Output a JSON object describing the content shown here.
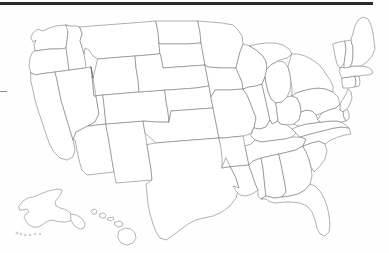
{
  "document": {
    "kind": "blank-us-states-outline-map",
    "title": "",
    "caption": "",
    "background_color": "#fefefe",
    "width": 389,
    "height": 253
  },
  "style": {
    "state_border_color": "#6f6f6f",
    "state_fill_color": "#ffffff",
    "inset_border_color": "#7b7b7b",
    "scan_artifact_color": "#2b2b2b",
    "left_dash_color": "#8d8d8d",
    "stroke_width": 0.55
  },
  "artifacts": [
    {
      "name": "scan-top-edge",
      "description": "",
      "x": 0,
      "y": 2,
      "width": 373,
      "height": 3,
      "color": "#2b2b2b"
    },
    {
      "name": "scan-left-dash",
      "description": "",
      "x": 0,
      "y": 91,
      "width": 7,
      "height": 1,
      "color": "#8d8d8d"
    }
  ],
  "map": {
    "region": "United States",
    "labels_visible": false,
    "legend_visible": false,
    "insets": [
      "Alaska",
      "Hawaii"
    ],
    "state_count": 49,
    "states": [
      {
        "code": "WA",
        "name": "Washington",
        "d": "M33 33 L38 29 L43 31 L49 28 L56 26 L66 25 L70 26 L68 32 L67 41 L66 48 L60 49 L50 49 L42 50 L35 51 L34 45 L36 40 L33 42 L31 38 Z"
      },
      {
        "code": "OR",
        "name": "Oregon",
        "d": "M35 51 L42 50 L50 49 L60 49 L66 48 L67 55 L68 62 L69 70 L63 71 L55 72 L47 73 L40 74 L36 75 L31 73 L29 66 L30 58 L32 53 Z"
      },
      {
        "code": "CA",
        "name": "California",
        "d": "M31 73 L36 75 L40 74 L47 73 L55 72 L57 80 L59 90 L61 100 L64 110 L67 120 L70 130 L73 140 L75 150 L73 157 L67 160 L60 158 L54 152 L50 145 L47 137 L44 128 L41 119 L38 110 L35 100 L33 90 L31 82 Z"
      },
      {
        "code": "NV",
        "name": "Nevada",
        "d": "M69 70 L76 69 L84 68 L91 67 L93 78 L95 90 L97 102 L99 114 L95 122 L88 126 L82 129 L76 132 L73 140 L70 130 L67 120 L64 110 L61 100 L59 90 L57 80 L55 72 L63 71 Z"
      },
      {
        "code": "ID",
        "name": "Idaho",
        "d": "M66 25 L70 26 L76 26 L80 27 L82 34 L80 41 L82 47 L84 54 L85 60 L86 67 L84 68 L76 69 L69 70 L68 62 L67 55 L66 48 L67 41 L68 32 Z"
      },
      {
        "code": "MT",
        "name": "Montana",
        "d": "M80 27 L92 26 L105 25 L118 24 L131 23 L144 22 L156 21 L158 32 L159 43 L160 54 L148 55 L135 56 L122 57 L110 58 L98 59 L93 56 L89 50 L85 48 L84 54 L82 47 L80 41 L82 34 Z"
      },
      {
        "code": "WY",
        "name": "Wyoming",
        "d": "M98 59 L110 58 L122 57 L135 56 L136 68 L138 80 L139 92 L127 93 L115 94 L103 95 L94 96 L93 86 L92 76 L91 67 L93 78 Z"
      },
      {
        "code": "UT",
        "name": "Utah",
        "d": "M91 67 L93 78 L92 76 L93 86 L94 96 L103 95 L104 105 L105 115 L106 124 L97 125 L90 126 L88 126 L95 122 L99 114 L97 102 L95 90 L93 78 Z"
      },
      {
        "code": "AZ",
        "name": "Arizona",
        "d": "M88 126 L90 126 L97 125 L106 124 L108 136 L110 148 L112 160 L114 172 L105 173 L96 174 L87 175 L82 170 L79 160 L77 150 L75 140 L73 140 L76 132 L82 129 Z"
      },
      {
        "code": "NM",
        "name": "New Mexico",
        "d": "M106 124 L118 123 L130 122 L143 121 L145 133 L147 145 L149 157 L151 169 L152 180 L140 181 L128 182 L116 183 L114 172 L112 160 L110 148 L108 136 Z"
      },
      {
        "code": "CO",
        "name": "Colorado",
        "d": "M103 95 L115 94 L127 93 L139 92 L152 91 L165 90 L166 101 L168 112 L169 122 L156 122 L143 121 L130 122 L118 123 L106 124 L105 115 L104 105 Z"
      },
      {
        "code": "ND",
        "name": "North Dakota",
        "d": "M156 21 L170 21 L184 21 L198 21 L200 32 L201 43 L187 44 L173 44 L160 44 L159 43 L158 32 Z"
      },
      {
        "code": "SD",
        "name": "South Dakota",
        "d": "M159 43 L160 44 L173 44 L187 44 L201 43 L203 54 L205 65 L191 66 L177 67 L163 68 L161 57 L160 54 Z"
      },
      {
        "code": "NE",
        "name": "Nebraska",
        "d": "M160 54 L161 57 L163 68 L177 67 L191 66 L205 65 L207 76 L209 86 L196 88 L182 89 L168 90 L165 90 L152 91 L139 92 L138 80 L136 68 L135 56 L148 55 Z"
      },
      {
        "code": "KS",
        "name": "Kansas",
        "d": "M165 90 L168 90 L182 89 L196 88 L209 86 L211 97 L213 108 L199 109 L185 110 L171 111 L169 122 L168 112 L166 101 Z"
      },
      {
        "code": "OK",
        "name": "Oklahoma",
        "d": "M169 122 L171 111 L185 110 L199 109 L213 108 L215 118 L217 128 L219 138 L206 139 L193 140 L180 141 L168 142 L156 143 L145 133 L143 121 L156 122 Z"
      },
      {
        "code": "TX",
        "name": "Texas",
        "d": "M156 143 L168 142 L180 141 L193 140 L206 139 L219 138 L222 148 L226 158 L231 168 L236 178 L239 188 L236 198 L230 206 L222 212 L213 216 L204 218 L196 220 L188 224 L180 230 L172 236 L166 240 L160 238 L156 232 L153 224 L150 214 L148 204 L147 194 L146 184 L152 180 L151 169 L149 157 L147 145 Z"
      },
      {
        "code": "MN",
        "name": "Minnesota",
        "d": "M198 21 L210 22 L222 23 L233 25 L238 30 L242 36 L243 44 L240 52 L238 60 L236 68 L222 68 L208 67 L205 65 L203 54 L201 43 L200 32 Z"
      },
      {
        "code": "IA",
        "name": "Iowa",
        "d": "M205 65 L208 67 L222 68 L236 68 L239 75 L242 82 L243 89 L229 90 L215 90 L211 97 L209 86 L207 76 Z"
      },
      {
        "code": "MO",
        "name": "Missouri",
        "d": "M211 97 L215 90 L229 90 L243 89 L247 95 L250 102 L253 110 L256 118 L254 128 L250 134 L243 136 L233 137 L224 138 L219 138 L217 128 L215 118 L213 108 Z"
      },
      {
        "code": "AR",
        "name": "Arkansas",
        "d": "M219 138 L224 138 L233 137 L243 136 L245 146 L247 156 L249 165 L238 166 L227 167 L222 168 L222 158 L221 148 Z"
      },
      {
        "code": "LA",
        "name": "Louisiana",
        "d": "M222 168 L227 167 L238 166 L249 165 L252 174 L255 183 L258 190 L252 194 L246 196 L240 195 L236 191 L233 186 L239 188 L236 178 L231 168 L226 158 Z"
      },
      {
        "code": "WI",
        "name": "Wisconsin",
        "d": "M236 68 L238 60 L240 52 L243 44 L250 46 L256 50 L262 55 L266 61 L267 69 L265 77 L262 84 L256 86 L249 87 L243 89 L242 82 L239 75 Z"
      },
      {
        "code": "MI-LP",
        "name": "Michigan Lower Peninsula",
        "d": "M267 69 L272 64 L278 61 L284 62 L288 67 L290 74 L291 82 L290 90 L287 97 L282 102 L276 103 L271 99 L268 92 L266 84 L265 77 Z"
      },
      {
        "code": "MI-UP",
        "name": "Michigan Upper Peninsula",
        "d": "M250 46 L258 44 L266 43 L275 43 L283 45 L289 49 L292 54 L287 58 L280 60 L272 64 L267 69 L266 61 L262 55 L256 50 Z"
      },
      {
        "code": "IL",
        "name": "Illinois",
        "d": "M243 89 L249 87 L256 86 L262 84 L264 93 L266 102 L268 111 L270 120 L266 127 L260 129 L254 128 L256 118 L253 110 L250 102 L247 95 Z"
      },
      {
        "code": "IN",
        "name": "Indiana",
        "d": "M262 84 L265 77 L266 84 L268 92 L271 99 L276 103 L277 112 L278 121 L272 124 L270 120 L268 111 L266 102 L264 93 Z"
      },
      {
        "code": "OH",
        "name": "Ohio",
        "d": "M276 103 L282 102 L287 97 L292 96 L297 98 L300 104 L301 112 L299 120 L294 124 L287 125 L280 124 L278 121 L277 112 Z"
      },
      {
        "code": "KY",
        "name": "Kentucky",
        "d": "M254 128 L260 129 L266 127 L270 120 L272 124 L278 121 L280 124 L287 125 L292 129 L296 133 L292 137 L285 139 L277 140 L269 141 L261 142 L255 140 L251 136 Z"
      },
      {
        "code": "TN",
        "name": "Tennessee",
        "d": "M249 165 L247 156 L245 146 L251 144 L255 140 L261 142 L269 141 L277 140 L285 139 L292 137 L300 137 L306 139 L303 146 L296 150 L288 152 L279 154 L270 156 L261 158 L253 161 Z"
      },
      {
        "code": "MS",
        "name": "Mississippi",
        "d": "M249 165 L253 161 L261 158 L263 168 L264 178 L265 188 L266 196 L261 199 L258 196 L258 190 L255 183 L252 174 Z"
      },
      {
        "code": "AL",
        "name": "Alabama",
        "d": "M263 168 L261 158 L270 156 L279 154 L281 164 L283 174 L285 184 L286 192 L282 197 L274 198 L266 196 L265 188 L264 178 Z"
      },
      {
        "code": "GA",
        "name": "Georgia",
        "d": "M279 154 L288 152 L296 150 L303 146 L306 152 L309 159 L311 167 L312 176 L310 184 L305 190 L298 194 L290 196 L282 197 L286 192 L285 184 L283 174 L281 164 Z"
      },
      {
        "code": "FL",
        "name": "Florida",
        "d": "M282 197 L290 196 L298 194 L305 190 L310 184 L315 186 L320 191 L324 198 L327 206 L329 215 L330 224 L329 232 L325 236 L320 234 L317 228 L315 220 L312 212 L307 206 L300 203 L292 202 L284 202 L276 203 L270 202 L266 199 L261 199 L266 196 L274 198 Z"
      },
      {
        "code": "SC",
        "name": "South Carolina",
        "d": "M303 146 L311 143 L319 141 L325 144 L327 151 L325 159 L320 166 L314 172 L311 167 L309 159 L306 152 Z"
      },
      {
        "code": "NC",
        "name": "North Carolina",
        "d": "M300 137 L306 139 L303 146 L311 143 L319 141 L325 144 L331 140 L338 137 L345 135 L351 134 L349 128 L342 127 L334 128 L326 130 L318 132 L310 134 Z"
      },
      {
        "code": "VA",
        "name": "Virginia",
        "d": "M296 133 L292 129 L299 126 L306 124 L314 123 L322 122 L330 121 L337 121 L343 123 L349 128 L342 127 L334 128 L326 130 L318 132 L310 134 L300 137 Z"
      },
      {
        "code": "WV",
        "name": "West Virginia",
        "d": "M294 124 L299 120 L301 112 L306 110 L312 111 L316 115 L318 120 L320 122 L314 123 L306 124 L299 126 Z"
      },
      {
        "code": "PA",
        "name": "Pennsylvania",
        "d": "M292 96 L297 98 L300 104 L301 112 L306 110 L312 111 L316 115 L322 113 L329 110 L336 108 L340 104 L338 97 L333 92 L326 89 L318 88 L310 89 L302 91 L296 93 Z"
      },
      {
        "code": "NY",
        "name": "New York",
        "d": "M292 54 L298 54 L305 56 L311 59 L317 63 L322 68 L326 74 L330 80 L333 86 L333 92 L326 89 L318 88 L310 89 L302 91 L296 93 L292 96 L292 88 L291 82 L290 74 L288 67 Z"
      },
      {
        "code": "NJ",
        "name": "New Jersey",
        "d": "M340 104 L343 99 L346 94 L348 89 L351 92 L352 98 L350 104 L347 109 L343 112 L340 110 Z"
      },
      {
        "code": "DE",
        "name": "Delaware",
        "d": "M343 112 L347 109 L349 113 L349 119 L346 121 L344 118 Z"
      },
      {
        "code": "MD",
        "name": "Maryland",
        "d": "M322 113 L329 110 L336 108 L340 104 L340 110 L343 112 L344 118 L346 121 L341 122 L337 121 L330 121 L322 122 L320 122 L318 120 Z"
      },
      {
        "code": "CT",
        "name": "Connecticut",
        "d": "M342 78 L349 77 L355 76 L356 82 L355 87 L349 88 L343 88 L342 83 Z"
      },
      {
        "code": "RI",
        "name": "Rhode Island",
        "d": "M355 76 L359 76 L360 82 L359 86 L355 87 L356 82 Z"
      },
      {
        "code": "MA",
        "name": "Massachusetts",
        "d": "M340 68 L347 67 L354 66 L361 66 L367 67 L371 69 L373 73 L369 75 L364 75 L359 76 L355 76 L349 77 L342 78 L340 74 Z"
      },
      {
        "code": "VT",
        "name": "Vermont",
        "d": "M333 44 L339 42 L345 41 L346 49 L345 57 L344 64 L340 68 L337 64 L335 56 L334 50 Z"
      },
      {
        "code": "NH",
        "name": "New Hampshire",
        "d": "M345 41 L351 40 L353 48 L353 56 L352 63 L350 67 L344 68 L344 64 L345 57 L346 49 Z"
      },
      {
        "code": "ME",
        "name": "Maine",
        "d": "M351 40 L353 33 L355 26 L358 20 L363 17 L368 19 L371 25 L373 33 L374 41 L375 49 L372 56 L367 62 L361 66 L354 66 L350 67 L352 63 L353 56 L353 48 Z"
      }
    ],
    "alaska_inset": {
      "name": "Alaska",
      "d": "M19 206 L23 201 L28 198 L33 197 L38 195 L43 193 L48 191 L53 190 L58 189 L62 190 L61 194 L58 198 L55 202 L56 206 L60 208 L64 209 L68 211 L71 214 L73 218 L70 221 L66 222 L61 222 L56 221 L51 220 L46 222 L42 225 L38 227 L33 227 L29 225 L26 221 L24 217 L26 214 L29 212 L27 209 L23 210 L20 210 Z",
      "panhandle_d": "M71 214 L76 215 L80 217 L83 220 L85 224 L84 228 L80 229 L76 227 L73 224 L71 220 Z",
      "aleutians": [
        {
          "cx": 17,
          "cy": 233,
          "r": 1.0
        },
        {
          "cx": 21,
          "cy": 234,
          "r": 0.9
        },
        {
          "cx": 25,
          "cy": 235,
          "r": 0.9
        },
        {
          "cx": 30,
          "cy": 235,
          "r": 0.8
        },
        {
          "cx": 35,
          "cy": 234,
          "r": 0.8
        },
        {
          "cx": 40,
          "cy": 234,
          "r": 0.8
        }
      ]
    },
    "hawaii_inset": {
      "name": "Hawaii",
      "islands": [
        {
          "island": "Kauai",
          "d": "M92 210 L95 209 L97 211 L96 214 L93 214 L91 212 Z"
        },
        {
          "island": "Oahu",
          "d": "M100 214 L104 213 L106 215 L105 218 L102 218 L100 217 Z"
        },
        {
          "island": "Molokai",
          "d": "M108 218 L113 217 L114 219 L111 221 L108 220 Z"
        },
        {
          "island": "Maui",
          "d": "M115 222 L120 221 L123 223 L122 226 L118 227 L115 225 Z"
        },
        {
          "island": "Hawaii (Big Island)",
          "d": "M119 231 L125 228 L131 229 L135 233 L136 238 L133 243 L127 245 L121 243 L118 238 Z"
        }
      ]
    }
  }
}
